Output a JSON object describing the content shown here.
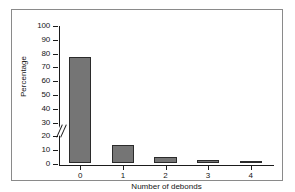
{
  "chart_data": {
    "type": "bar",
    "title": "",
    "subtitle": "",
    "xlabel": "Number of debonds",
    "ylabel": "Percentage",
    "categories": [
      "0",
      "1",
      "2",
      "3",
      "4"
    ],
    "values": [
      77,
      13,
      4.5,
      2.5,
      1
    ],
    "series": [
      {
        "name": "Percentage",
        "values": [
          77,
          13,
          4.5,
          2.5,
          1
        ]
      }
    ],
    "ylim": [
      0,
      100
    ],
    "yticks": [
      0,
      10,
      20,
      30,
      40,
      50,
      60,
      70,
      80,
      90,
      100
    ],
    "ytick_labels": [
      "0",
      "10",
      "20",
      "30",
      "40",
      "50",
      "60",
      "70",
      "80",
      "90",
      "100"
    ],
    "xtick_labels": [
      "0",
      "1",
      "2",
      "3",
      "4"
    ],
    "grid": false,
    "legend": null,
    "legend_position": "none",
    "axis_break": {
      "axis": "y",
      "between": [
        20,
        30
      ],
      "symbol": "double-slash"
    },
    "annotations": [],
    "colors": {
      "bar_fill": "#757575",
      "bar_edge": "#2b2b2b",
      "axis": "#1b1b1b",
      "text": "#161616",
      "background": "#ffffff",
      "frame": "#8a8a8a"
    }
  }
}
